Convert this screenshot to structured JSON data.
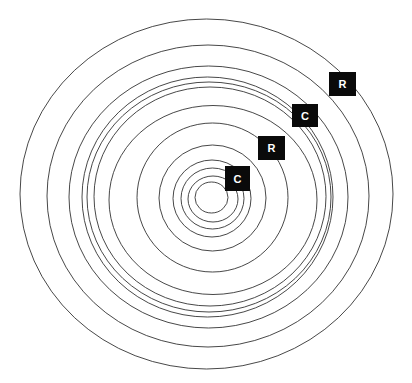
{
  "diagram": {
    "type": "concentric-rings",
    "background": "#ffffff",
    "stroke_color": "#333333",
    "rings": [
      {
        "cx": 206.5,
        "cy": 194,
        "rx": 186.5,
        "ry": 175
      },
      {
        "cx": 208,
        "cy": 196,
        "rx": 161,
        "ry": 151
      },
      {
        "cx": 208.5,
        "cy": 197,
        "rx": 139.5,
        "ry": 131
      },
      {
        "cx": 207.5,
        "cy": 197,
        "rx": 125.5,
        "ry": 120
      },
      {
        "cx": 209,
        "cy": 197,
        "rx": 122,
        "ry": 115
      },
      {
        "cx": 210,
        "cy": 196.5,
        "rx": 116,
        "ry": 109.5
      },
      {
        "cx": 213,
        "cy": 200,
        "rx": 104,
        "ry": 94.5
      },
      {
        "cx": 212.5,
        "cy": 197.5,
        "rx": 75.5,
        "ry": 74.5
      },
      {
        "cx": 212.5,
        "cy": 198,
        "rx": 53.5,
        "ry": 53
      },
      {
        "cx": 212,
        "cy": 198.5,
        "rx": 39,
        "ry": 38.5
      },
      {
        "cx": 212.5,
        "cy": 198.5,
        "rx": 31.5,
        "ry": 30.5
      },
      {
        "cx": 213,
        "cy": 199,
        "rx": 25,
        "ry": 23
      },
      {
        "cx": 211.5,
        "cy": 197.5,
        "rx": 16.5,
        "ry": 15.5
      }
    ],
    "labels": [
      {
        "text": "C",
        "x": 225,
        "y": 166,
        "w": 25,
        "h": 25
      },
      {
        "text": "R",
        "x": 258,
        "y": 136,
        "w": 27,
        "h": 24
      },
      {
        "text": "C",
        "x": 292,
        "y": 104,
        "w": 26,
        "h": 23
      },
      {
        "text": "R",
        "x": 329,
        "y": 72,
        "w": 27,
        "h": 24
      }
    ],
    "label_fill": "#0a0a0a",
    "label_text_color": "#ffffff"
  }
}
